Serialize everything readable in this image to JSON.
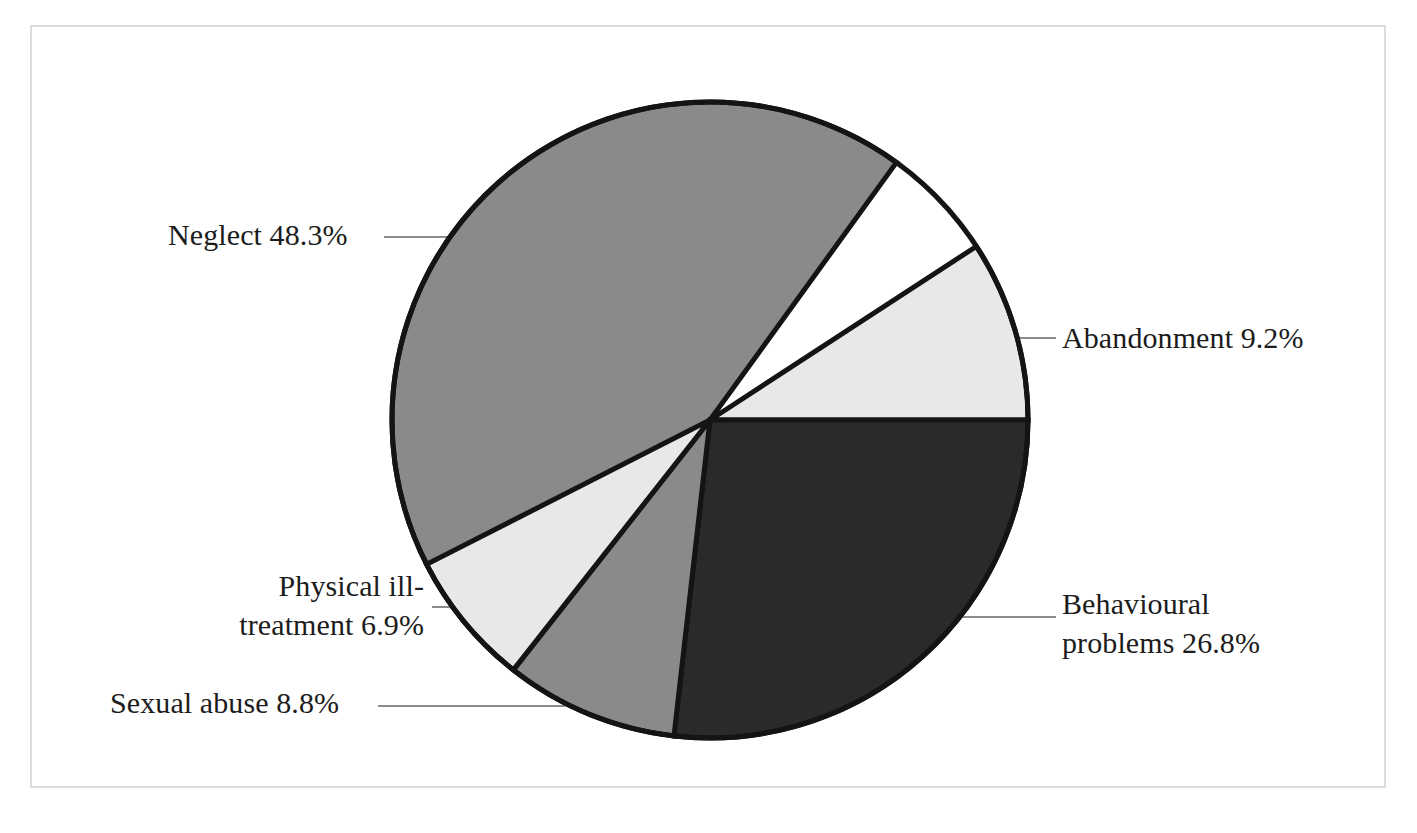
{
  "chart_data": {
    "type": "pie",
    "title": "",
    "subtitle": "",
    "xlabel": "",
    "ylabel": "",
    "legend_position": "none",
    "grid": false,
    "unit": "percent",
    "total": 100.0,
    "labels": [
      "Neglect",
      "Abandonment",
      "Behavioural problems",
      "Sexual abuse",
      "Physical ill-treatment"
    ],
    "values": [
      48.3,
      9.2,
      26.8,
      8.8,
      6.9
    ],
    "slices": [
      {
        "name": "neglect",
        "label": "Neglect",
        "value": 48.3,
        "label_text": "Neglect 48.3%",
        "color": "#8a8a8a",
        "start_angle_deg": 222.0,
        "end_angle_deg": 395.9
      },
      {
        "name": "abandonment",
        "label": "Abandonment",
        "value": 9.2,
        "label_text": "Abandonment 9.2%",
        "color": "#e8e8e8",
        "start_angle_deg": 56.9,
        "end_angle_deg": 90.0
      },
      {
        "name": "behavioural-problems",
        "label": "Behavioural problems",
        "value": 26.8,
        "label_text": "Behavioural\nproblems 26.8%",
        "color": "#2a2a2a",
        "start_angle_deg": 90.0,
        "end_angle_deg": 186.5
      },
      {
        "name": "sexual-abuse",
        "label": "Sexual abuse",
        "value": 8.8,
        "label_text": "Sexual abuse 8.8%",
        "color": "#8a8a8a",
        "start_angle_deg": 186.5,
        "end_angle_deg": 218.2
      },
      {
        "name": "physical-ill-treatment",
        "label": "Physical ill-treatment",
        "value": 6.9,
        "label_text": "Physical ill-\ntreatment 6.9%",
        "color": "#e8e8e8",
        "start_angle_deg": 218.2,
        "end_angle_deg": 243.0
      }
    ],
    "style": {
      "outline_color": "#141414",
      "outline_width": 5,
      "leader_line_color": "#8c8c8c",
      "background": "#ffffff",
      "frame_color": "#dcdcdc",
      "text_color": "#1c1c1c",
      "center_x": 710,
      "center_y": 420,
      "radius": 318
    }
  },
  "labels": {
    "neglect": "Neglect 48.3%",
    "abandonment": "Abandonment 9.2%",
    "behavioural": "Behavioural\nproblems 26.8%",
    "physical": "Physical ill-\ntreatment 6.9%",
    "sexual": "Sexual abuse 8.8%"
  }
}
